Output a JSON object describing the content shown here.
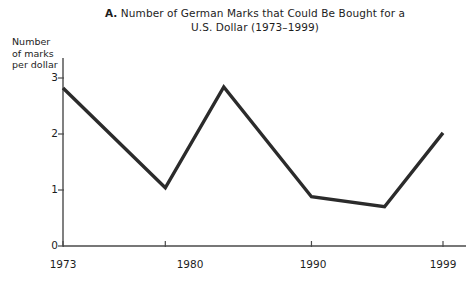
{
  "figure": {
    "panel_letter": "A.",
    "title_line1": " Number of German Marks that Could Be Bought for a",
    "title_line2": "U.S. Dollar (1973–1999)",
    "ylabel_line1": "Number",
    "ylabel_line2": "of marks",
    "ylabel_line3": "per dollar",
    "line_color": "#2b2b2b",
    "axis_color": "#4a4a4a"
  },
  "chart_data": {
    "type": "line",
    "title": "A. Number of German Marks that Could Be Bought for a U.S. Dollar (1973–1999)",
    "xlabel": "",
    "ylabel": "Number of marks per dollar",
    "xlim": [
      1973,
      1999
    ],
    "ylim": [
      0,
      3
    ],
    "grid": false,
    "legend": "none",
    "xticks": [
      1973,
      1980,
      1990,
      1999
    ],
    "xtick_labels": [
      "1973",
      "1980",
      "1990",
      "1999"
    ],
    "yticks": [
      0,
      1,
      2,
      3
    ],
    "ytick_labels": [
      "0",
      "1",
      "2",
      "3"
    ],
    "series": [
      {
        "name": "Marks per U.S. dollar",
        "x": [
          1973,
          1980,
          1984,
          1990,
          1995,
          1999
        ],
        "values": [
          2.82,
          1.04,
          2.84,
          0.88,
          0.7,
          2.02
        ]
      }
    ]
  }
}
